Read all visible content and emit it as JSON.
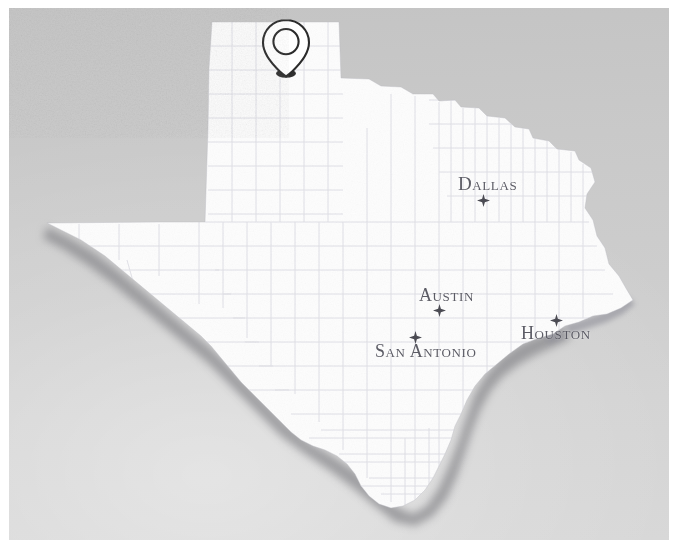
{
  "figure": {
    "kind": "scanned-map-photograph",
    "width": 678,
    "height": 548
  },
  "map": {
    "state_name": "Texas",
    "state_fill": "#fdfdfd",
    "county_line_color": "#d8d8e0",
    "background_color": "#cccccc",
    "shadow_color": "#8f8f92",
    "border_margin_color": "#ffffff",
    "features": {
      "county_lines_visible": true,
      "coastline_shadow": true,
      "panhandle_visible": true
    }
  },
  "cities": [
    {
      "name": "Dallas",
      "label": "Dallas",
      "marker": "star",
      "label_x": 449,
      "label_y": 166,
      "star_x": 468,
      "star_y": 186,
      "star_position": "below-label"
    },
    {
      "name": "Austin",
      "label": "Austin",
      "marker": "star",
      "label_x": 410,
      "label_y": 278,
      "star_x": 424,
      "star_y": 296,
      "star_position": "below-label"
    },
    {
      "name": "San Antonio",
      "label": "San Antonio",
      "marker": "star",
      "label_x": 366,
      "label_y": 334,
      "star_x": 400,
      "star_y": 323,
      "star_position": "above-left-of-label"
    },
    {
      "name": "Houston",
      "label": "Houston",
      "marker": "star",
      "label_x": 512,
      "label_y": 316,
      "star_x": 541,
      "star_y": 306,
      "star_position": "above-left-of-label"
    }
  ],
  "pin": {
    "icon": "map-pin-icon",
    "description": "outlined teardrop map pin with hollow circle and dark shadow at the tip",
    "x": 246,
    "y": 8,
    "width": 62,
    "height": 68,
    "tip_x": 276,
    "tip_y": 65,
    "outline_color": "#2e2e2e",
    "fill_color": "#ffffff",
    "located_over": "Texas Panhandle"
  }
}
